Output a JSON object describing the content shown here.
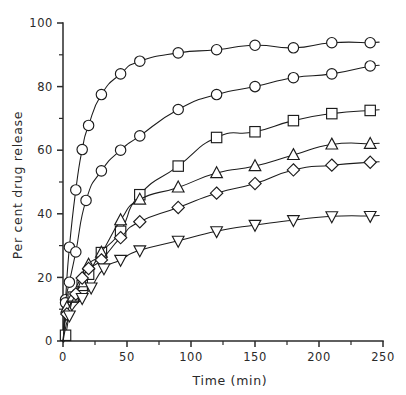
{
  "chart_data": {
    "type": "line",
    "title": "",
    "xlabel": "Time (min)",
    "ylabel": "Per cent drug release",
    "xlim": [
      0,
      250
    ],
    "ylim": [
      0,
      100
    ],
    "grid": false,
    "legend": "none",
    "x_ticks": [
      0,
      50,
      100,
      150,
      200,
      250
    ],
    "x_tick_labels": [
      "0",
      "50",
      "100",
      "150",
      "200",
      "250"
    ],
    "x_minor_ticks": [
      25,
      75,
      125,
      175,
      225
    ],
    "y_ticks": [
      0,
      20,
      40,
      60,
      80,
      100
    ],
    "y_tick_labels": [
      "0",
      "20",
      "40",
      "60",
      "80",
      "100"
    ],
    "y_minor_ticks": [
      10,
      30,
      50,
      70,
      90
    ],
    "series": [
      {
        "name": "series-1",
        "marker": "circle",
        "x": [
          0,
          2,
          5,
          10,
          15,
          20,
          30,
          45,
          60,
          90,
          120,
          150,
          180,
          210,
          240
        ],
        "y": [
          0,
          13,
          29.5,
          47.5,
          60.2,
          67.8,
          77.5,
          84.0,
          88.0,
          90.6,
          91.6,
          93.0,
          92.2,
          93.8,
          93.8
        ]
      },
      {
        "name": "series-2",
        "marker": "circle",
        "x": [
          0,
          2,
          5,
          10,
          18,
          30,
          45,
          60,
          90,
          120,
          150,
          180,
          210,
          240
        ],
        "y": [
          0,
          12,
          18.5,
          28.0,
          44.2,
          53.5,
          60.0,
          64.5,
          72.8,
          77.5,
          80.0,
          82.8,
          84.0,
          86.5
        ]
      },
      {
        "name": "series-3",
        "marker": "square",
        "x": [
          0,
          2,
          8,
          15,
          20,
          30,
          45,
          60,
          90,
          120,
          150,
          180,
          210,
          240
        ],
        "y": [
          0,
          1.8,
          13.8,
          17.5,
          21.0,
          27.8,
          34.5,
          46.0,
          55.0,
          64.0,
          65.8,
          69.3,
          71.5,
          72.5
        ]
      },
      {
        "name": "series-4",
        "marker": "triangle-up",
        "x": [
          0,
          3,
          8,
          15,
          20,
          30,
          45,
          60,
          90,
          120,
          150,
          180,
          210,
          240
        ],
        "y": [
          0,
          10.5,
          14.0,
          18.5,
          24.0,
          27.8,
          38.0,
          44.5,
          48.3,
          52.8,
          55.0,
          58.5,
          61.8,
          62.0
        ]
      },
      {
        "name": "series-5",
        "marker": "diamond",
        "x": [
          0,
          3,
          10,
          15,
          20,
          30,
          45,
          60,
          90,
          120,
          150,
          180,
          210,
          240
        ],
        "y": [
          0,
          8.5,
          14.8,
          19.8,
          22.8,
          25.5,
          32.5,
          37.5,
          42.0,
          46.5,
          49.5,
          53.8,
          55.3,
          56.2
        ]
      },
      {
        "name": "series-6",
        "marker": "triangle-down",
        "x": [
          0,
          5,
          15,
          22,
          32,
          45,
          60,
          90,
          120,
          150,
          180,
          210,
          240
        ],
        "y": [
          0,
          8.0,
          13.5,
          16.8,
          22.8,
          25.5,
          28.5,
          31.5,
          34.5,
          36.5,
          38.0,
          39.2,
          39.3
        ]
      }
    ]
  }
}
